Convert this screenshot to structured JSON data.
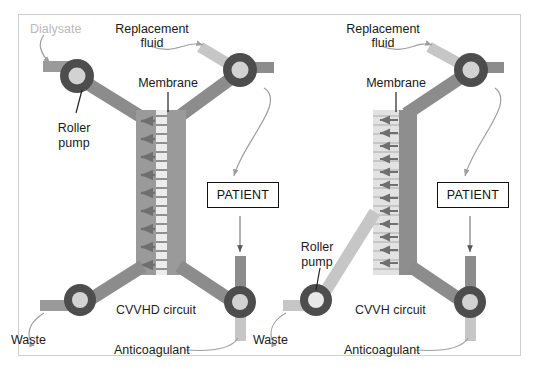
{
  "figure": {
    "background_color": "#ffffff",
    "frame_color": "#cfcfcf"
  },
  "palette": {
    "blood_tube_dark": "#8c8c8c",
    "blood_tube_darker": "#7d7d7d",
    "fluid_tube_light": "#c6c6c6",
    "membrane_blood_side": "#9a9a9a",
    "membrane_dialysate_side": "#9a9a9a",
    "membrane_light": "#dcdcdc",
    "pump_ring": "#4d4d4d",
    "pump_center": "#d2d2d2",
    "leader_line": "#9e9e9e",
    "label_text": "#1a1a1a",
    "dialysate_text": "#b9b9b9",
    "patient_border": "#111111"
  },
  "left_circuit": {
    "name": "CVVHD circuit",
    "caption": "CVVHD circuit",
    "labels": {
      "dialysate": "Dialysate",
      "replacement_fluid_line1": "Replacement",
      "replacement_fluid_line2": "fluid",
      "membrane": "Membrane",
      "roller_pump_line1": "Roller",
      "roller_pump_line2": "pump",
      "waste": "Waste",
      "anticoagulant": "Anticoagulant",
      "patient": "PATIENT"
    }
  },
  "right_circuit": {
    "name": "CVVH circuit",
    "caption": "CVVH circuit",
    "labels": {
      "replacement_fluid_line1": "Replacement",
      "replacement_fluid_line2": "fluid",
      "membrane": "Membrane",
      "roller_pump_line1": "Roller",
      "roller_pump_line2": "pump",
      "waste": "Waste",
      "anticoagulant": "Anticoagulant",
      "patient": "PATIENT"
    }
  }
}
